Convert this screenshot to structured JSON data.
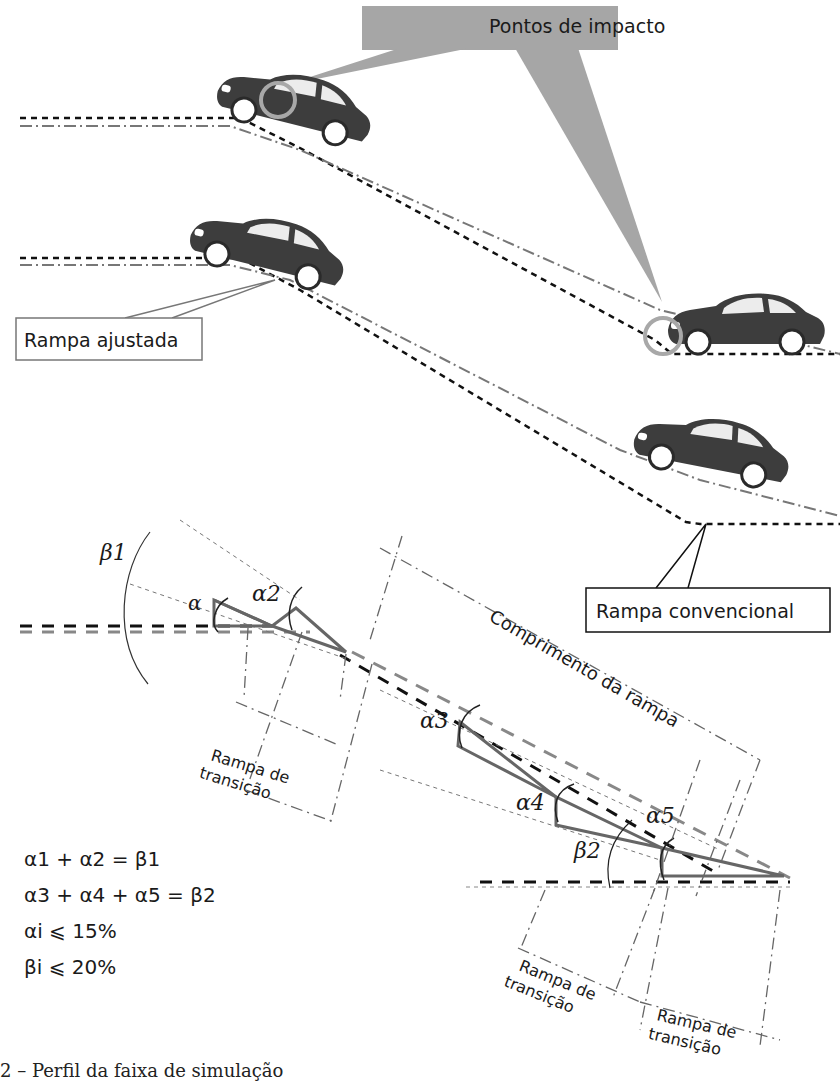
{
  "top_section": {
    "callout_impact": "Pontos de impacto",
    "label_adjusted": "Rampa ajustada",
    "label_conventional": "Rampa convencional"
  },
  "bottom_section": {
    "angles": {
      "alpha1": "α",
      "alpha2": "α2",
      "alpha3": "α3",
      "alpha4": "α4",
      "alpha5": "α5",
      "beta1": "β1",
      "beta2": "β2"
    },
    "ramp_length_label": "Comprimento da rampa",
    "transition_1": {
      "line1": "Rampa de",
      "line2": "transição"
    },
    "transition_2": {
      "line1": "Rampa de",
      "line2": "transição"
    },
    "transition_3": {
      "line1": "Rampa de",
      "line2": "transição"
    },
    "formulas": [
      "α1 + α2 = β1",
      "α3 + α4 + α5 = β2",
      "αi ⩽ 15%",
      "βi ⩽ 20%"
    ]
  },
  "caption": "2 – Perfil da faixa de simulação",
  "colors": {
    "car_body": "#3d3d3d",
    "impact_circle": "#a8a8a8",
    "callout_fill": "#a6a6a6",
    "ramp_gray": "#666666",
    "line_black": "#111111"
  }
}
